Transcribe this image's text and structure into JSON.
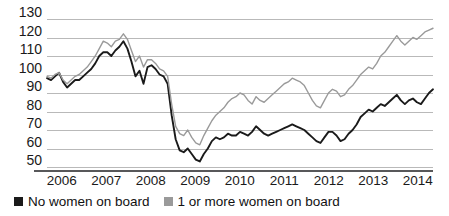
{
  "chart_data": {
    "type": "line",
    "title": "",
    "subtitle": "",
    "xlabel": "",
    "ylabel": "",
    "xlim": [
      2006.0,
      2014.67
    ],
    "ylim": [
      50,
      130
    ],
    "grid": true,
    "legend_position": "bottom-left",
    "y_ticks": [
      130,
      120,
      110,
      100,
      90,
      80,
      70,
      60,
      50
    ],
    "x_ticks": [
      "2006",
      "2007",
      "2008",
      "2009",
      "2010",
      "2011",
      "2012",
      "2013",
      "2014"
    ],
    "colors": {
      "no_women": "#1a1a1a",
      "one_or_more_women": "#9a9a9a",
      "gridline": "#b9b9b9",
      "axis": "#58585a"
    },
    "series": [
      {
        "name": "No women on board",
        "color": "#1a1a1a",
        "values": [
          98,
          97,
          99,
          101,
          96,
          93,
          95,
          97,
          97,
          99,
          101,
          103,
          106,
          110,
          112,
          112,
          110,
          113,
          115,
          118,
          114,
          107,
          99,
          102,
          95,
          104,
          105,
          103,
          100,
          99,
          95,
          78,
          65,
          59,
          58,
          60,
          57,
          54,
          53,
          57,
          60,
          64,
          66,
          65,
          66,
          68,
          67,
          67,
          69,
          68,
          67,
          69,
          72,
          70,
          68,
          67,
          68,
          69,
          70,
          71,
          72,
          73,
          72,
          71,
          70,
          68,
          66,
          64,
          63,
          66,
          69,
          69,
          67,
          64,
          65,
          68,
          70,
          73,
          77,
          79,
          81,
          80,
          82,
          84,
          83,
          85,
          87,
          89,
          86,
          84,
          86,
          87,
          85,
          84,
          87,
          90,
          92
        ]
      },
      {
        "name": "1 or more women on board",
        "color": "#9a9a9a",
        "values": [
          99,
          98,
          100,
          101,
          97,
          95,
          97,
          99,
          100,
          102,
          104,
          107,
          110,
          114,
          118,
          117,
          115,
          118,
          119,
          122,
          119,
          113,
          107,
          110,
          104,
          108,
          108,
          106,
          103,
          102,
          99,
          84,
          72,
          68,
          67,
          70,
          66,
          63,
          62,
          67,
          71,
          75,
          78,
          80,
          82,
          85,
          87,
          88,
          90,
          89,
          86,
          84,
          88,
          86,
          85,
          87,
          89,
          91,
          93,
          95,
          96,
          98,
          97,
          96,
          94,
          90,
          86,
          83,
          82,
          86,
          90,
          92,
          91,
          88,
          89,
          92,
          94,
          97,
          100,
          102,
          104,
          103,
          106,
          110,
          112,
          115,
          118,
          121,
          118,
          116,
          118,
          120,
          119,
          121,
          123,
          124,
          125
        ]
      }
    ]
  },
  "legend": {
    "entries": [
      {
        "label": "No women on board",
        "color": "#1a1a1a"
      },
      {
        "label": "1 or more women on board",
        "color": "#9a9a9a"
      }
    ]
  }
}
